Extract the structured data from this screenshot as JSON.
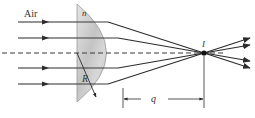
{
  "diagram": {
    "labels": {
      "medium": "Air",
      "index": "n",
      "radius": "R",
      "image_point": "I",
      "image_distance": "q"
    },
    "colors": {
      "ray": "#2b2b2b",
      "lens_fill": "#cfcfcf",
      "lens_edge": "#9a9a9a",
      "axis": "#3a3a3a",
      "background": "#ffffff"
    },
    "rays_count": 4,
    "optical_axis": "dashed"
  }
}
